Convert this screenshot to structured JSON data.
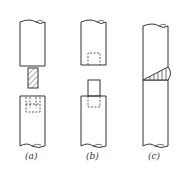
{
  "figure": {
    "panels": [
      {
        "id": "a",
        "label": "(a)",
        "description": "rod pair joined by hatched pin into socket"
      },
      {
        "id": "b",
        "label": "(b)",
        "description": "rod with tenon block into socket of other rod"
      },
      {
        "id": "c",
        "label": "(c)",
        "description": "continuous rod with weld joint"
      }
    ]
  },
  "colors": {
    "line": "#333333",
    "hatch": "#555555",
    "background": "#ffffff"
  }
}
